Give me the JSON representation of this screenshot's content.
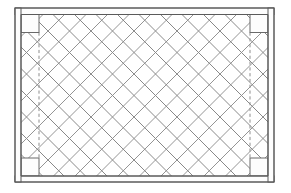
{
  "drawing": {
    "title": "Lattice Panel Elevation",
    "background_color": "#ffffff",
    "width": 291,
    "height": 193,
    "line_color": "#5a5a5a",
    "lattice_color": "#7a7a7a",
    "hidden_line_color": "#8d8d8d",
    "view": "front elevation"
  },
  "frame": {
    "label": "outer frame",
    "outer": {
      "x": 15,
      "y": 8,
      "width": 259,
      "height": 174
    },
    "inner": {
      "x": 21,
      "y": 14.5,
      "width": 247,
      "height": 161.5
    },
    "stile_width": 6,
    "rail_height": 6.5,
    "top_rail_label": "top rail",
    "bottom_rail_label": "bottom rail",
    "left_stile_label": "left stile",
    "right_stile_label": "right stile"
  },
  "corner_blocks": [
    {
      "name": "top-left",
      "x": 21,
      "y": 14.5,
      "width": 18,
      "height": 18
    },
    {
      "name": "top-right",
      "x": 250,
      "y": 14.5,
      "width": 18,
      "height": 18
    },
    {
      "name": "bottom-left",
      "x": 21,
      "y": 158,
      "width": 18,
      "height": 18
    },
    {
      "name": "bottom-right",
      "x": 250,
      "y": 158,
      "width": 18,
      "height": 18
    }
  ],
  "hidden_lines": [
    {
      "name": "left-reveal",
      "x": 39,
      "y1": 32.5,
      "y2": 158
    },
    {
      "name": "right-reveal",
      "x": 250,
      "y1": 32.5,
      "y2": 158
    }
  ],
  "lattice": {
    "label": "diagonal lattice infill",
    "angle_degrees": 45,
    "spacing": 21.5,
    "region": {
      "x": 21,
      "y": 15,
      "width": 247,
      "height": 161
    },
    "direction_a_label": "lattice slats rising right",
    "direction_b_label": "lattice slats falling right"
  },
  "chart_data": {
    "type": "table",
    "categories": [
      "frame",
      "corner blocks",
      "lattice",
      "hidden lines"
    ],
    "values": [
      1,
      4,
      2,
      2
    ]
  }
}
